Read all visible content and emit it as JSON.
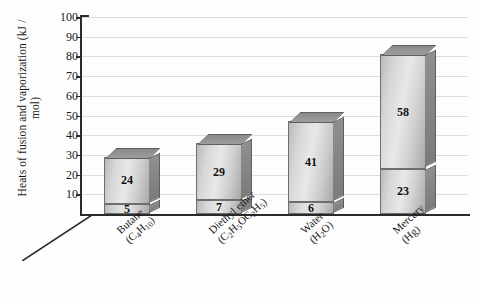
{
  "chart_data": {
    "type": "bar",
    "title": "",
    "xlabel": "",
    "ylabel": "Heats of fusion and vaporization (kJ / mol)",
    "ylim": [
      0,
      100
    ],
    "yticks": [
      100,
      90,
      80,
      70,
      60,
      50,
      40,
      30,
      20,
      10
    ],
    "grid": true,
    "legend": "none",
    "stacked": true,
    "style": "3d-column",
    "categories": [
      {
        "line1": "Butane",
        "line2_pre": "(C",
        "line2_sub1": "4",
        "line2_mid": "H",
        "line2_sub2": "10",
        "line2_post": ")",
        "plain": "Butane (C4H10)"
      },
      {
        "line1": "Diethyl ether",
        "line2_pre": "(C",
        "line2_sub1": "2",
        "line2_mid": "H",
        "line2_sub2": "5",
        "line2_post": "OC2H5)",
        "plain": "Diethyl ether (C2H5OC2H5)"
      },
      {
        "line1": "Water",
        "line2_pre": "(H",
        "line2_sub1": "2",
        "line2_mid": "O",
        "line2_sub2": "",
        "line2_post": ")",
        "plain": "Water (H2O)"
      },
      {
        "line1": "Mercury",
        "line2_pre": "(Hg",
        "line2_sub1": "",
        "line2_mid": "",
        "line2_sub2": "",
        "line2_post": ")",
        "plain": "Mercury (Hg)"
      }
    ],
    "series": [
      {
        "name": "Heat of fusion",
        "values": [
          5,
          7,
          6,
          23
        ]
      },
      {
        "name": "Heat of vaporization",
        "values": [
          24,
          29,
          41,
          58
        ]
      }
    ],
    "totals": [
      29,
      36,
      47,
      81
    ]
  },
  "colors": {
    "axis": "#2b2b2b",
    "grid": "#dcdcdc",
    "bar_front": "#d9d9d9",
    "bar_side": "#858585",
    "bar_top": "#929292",
    "bar_edge": "#6e6e6e",
    "background": "#fdfdfd",
    "text": "#1a1a1a"
  }
}
